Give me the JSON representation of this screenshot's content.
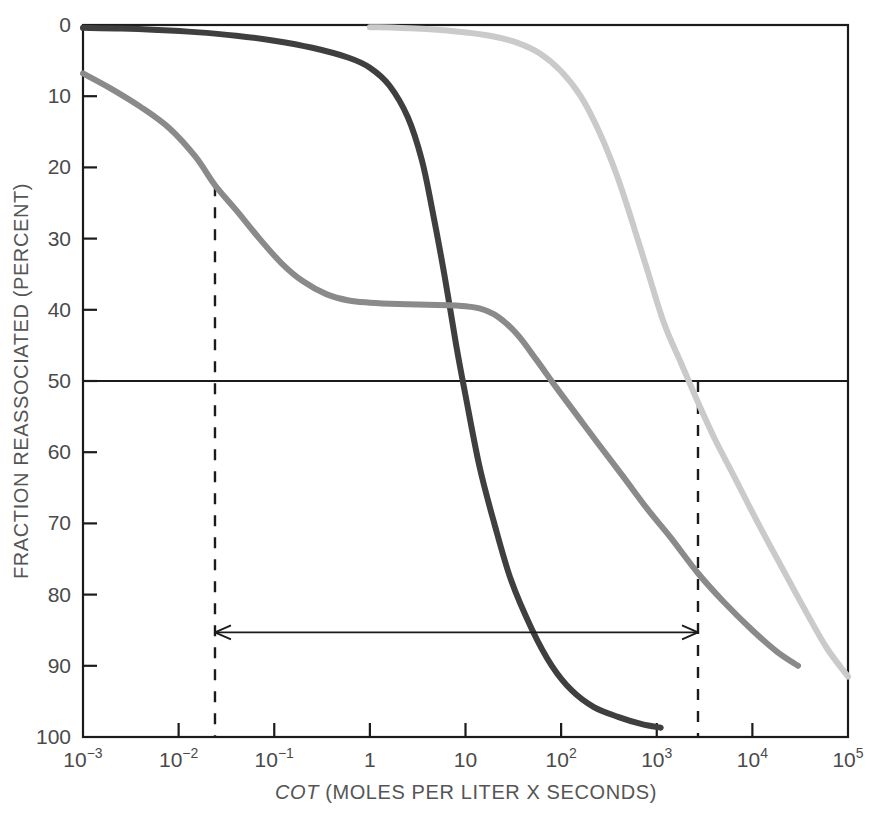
{
  "figure": {
    "width": 883,
    "height": 814,
    "background": "#ffffff"
  },
  "chart_data": {
    "type": "line",
    "title": "",
    "xlabel_prefix": "COT",
    "xlabel_rest": " (MOLES PER LITER X SECONDS)",
    "xlabel": "COT (MOLES PER LITER X SECONDS)",
    "ylabel": "FRACTION REASSOCIATED (PERCENT)",
    "xscale": "log",
    "xlim": [
      0.001,
      100000
    ],
    "ylim": [
      0,
      100
    ],
    "y_axis_inverted": true,
    "grid": false,
    "legend": false,
    "x_tick_labels": [
      "10−3",
      "10−2",
      "10−1",
      "1",
      "10",
      "10²",
      "10³",
      "10⁴",
      "10⁵"
    ],
    "x_tick_bases": [
      "10",
      "10",
      "10",
      "1",
      "10",
      "10",
      "10",
      "10",
      "10"
    ],
    "x_tick_exponents": [
      "-3",
      "-2",
      "-1",
      "",
      "",
      "2",
      "3",
      "4",
      "5"
    ],
    "x_tick_values": [
      0.001,
      0.01,
      0.1,
      1,
      10,
      100,
      1000,
      10000,
      100000
    ],
    "y_tick_labels": [
      "0",
      "10",
      "20",
      "30",
      "40",
      "50",
      "60",
      "70",
      "80",
      "90",
      "100"
    ],
    "y_tick_values": [
      0,
      10,
      20,
      30,
      40,
      50,
      60,
      70,
      80,
      90,
      100
    ],
    "reference_lines": [
      {
        "name": "fifty-percent-line",
        "orientation": "horizontal",
        "y": 50,
        "style": "solid",
        "color": "#1b1b1b"
      },
      {
        "name": "left-marker",
        "orientation": "vertical",
        "x": 0.024,
        "y_from": 22.5,
        "y_to": 100,
        "style": "dashed",
        "color": "#1b1b1b"
      },
      {
        "name": "right-marker",
        "orientation": "vertical",
        "x": 2700,
        "y_from": 50,
        "y_to": 100,
        "style": "dashed",
        "color": "#1b1b1b"
      }
    ],
    "annotations": [
      {
        "name": "span-arrow",
        "type": "double-headed-arrow",
        "x_from": 0.024,
        "x_to": 2700,
        "y": 85.3,
        "label": ""
      }
    ],
    "series": [
      {
        "name": "fast-component",
        "color": "#3f3f3f",
        "linewidth": 6,
        "points": [
          [
            0.001,
            0.4
          ],
          [
            0.0025,
            0.5
          ],
          [
            0.006,
            0.7
          ],
          [
            0.015,
            1.0
          ],
          [
            0.04,
            1.5
          ],
          [
            0.1,
            2.2
          ],
          [
            0.25,
            3.2
          ],
          [
            0.6,
            4.6
          ],
          [
            1.0,
            6.0
          ],
          [
            1.6,
            8.5
          ],
          [
            2.5,
            13.0
          ],
          [
            3.5,
            19.0
          ],
          [
            4.5,
            26.0
          ],
          [
            6.0,
            35.0
          ],
          [
            8.0,
            45.0
          ],
          [
            10.0,
            52.0
          ],
          [
            14.0,
            62.0
          ],
          [
            20.0,
            70.0
          ],
          [
            30.0,
            78.0
          ],
          [
            50.0,
            85.0
          ],
          [
            80.0,
            90.0
          ],
          [
            130.0,
            93.5
          ],
          [
            220.0,
            95.8
          ],
          [
            400.0,
            97.2
          ],
          [
            700.0,
            98.2
          ],
          [
            1100.0,
            98.7
          ]
        ]
      },
      {
        "name": "intermediate-component",
        "color": "#8a8a8a",
        "linewidth": 6,
        "points": [
          [
            0.001,
            6.8
          ],
          [
            0.002,
            9.0
          ],
          [
            0.004,
            11.5
          ],
          [
            0.008,
            14.5
          ],
          [
            0.015,
            18.5
          ],
          [
            0.024,
            22.5
          ],
          [
            0.04,
            26.0
          ],
          [
            0.07,
            30.0
          ],
          [
            0.12,
            33.5
          ],
          [
            0.2,
            36.0
          ],
          [
            0.35,
            37.8
          ],
          [
            0.6,
            38.7
          ],
          [
            1.0,
            39.0
          ],
          [
            2.0,
            39.2
          ],
          [
            4.0,
            39.3
          ],
          [
            8.0,
            39.4
          ],
          [
            14.0,
            39.8
          ],
          [
            22.0,
            41.0
          ],
          [
            35.0,
            43.5
          ],
          [
            55.0,
            47.0
          ],
          [
            90.0,
            51.0
          ],
          [
            150.0,
            55.0
          ],
          [
            250.0,
            59.0
          ],
          [
            450.0,
            63.5
          ],
          [
            800.0,
            68.0
          ],
          [
            1400.0,
            72.0
          ],
          [
            2700.0,
            77.0
          ],
          [
            5000.0,
            81.0
          ],
          [
            10000.0,
            85.0
          ],
          [
            18000.0,
            88.0
          ],
          [
            30000.0,
            90.0
          ]
        ]
      },
      {
        "name": "slow-component",
        "color": "#cacaca",
        "linewidth": 6,
        "points": [
          [
            1.0,
            0.3
          ],
          [
            3.0,
            0.5
          ],
          [
            8.0,
            0.9
          ],
          [
            18.0,
            1.5
          ],
          [
            35.0,
            2.5
          ],
          [
            60.0,
            4.0
          ],
          [
            100.0,
            6.5
          ],
          [
            160.0,
            10.0
          ],
          [
            250.0,
            15.0
          ],
          [
            380.0,
            21.0
          ],
          [
            550.0,
            27.5
          ],
          [
            800.0,
            34.5
          ],
          [
            1200.0,
            42.0
          ],
          [
            1800.0,
            47.5
          ],
          [
            2700.0,
            53.0
          ],
          [
            4000.0,
            58.0
          ],
          [
            6500.0,
            63.5
          ],
          [
            11000.0,
            69.5
          ],
          [
            20000.0,
            76.0
          ],
          [
            35000.0,
            82.0
          ],
          [
            60000.0,
            87.5
          ],
          [
            100000.0,
            91.5
          ]
        ]
      }
    ]
  },
  "colors": {
    "axis": "#1b1b1b",
    "tick_text": "#4a4a4a",
    "title_text": "#555555",
    "series_fast": "#3f3f3f",
    "series_intermediate": "#8a8a8a",
    "series_slow": "#cacaca",
    "background": "#ffffff"
  }
}
